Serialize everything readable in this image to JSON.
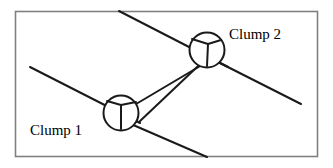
{
  "figure": {
    "background_color": "#ffffff",
    "border": {
      "color": "#808080",
      "width": 1.6,
      "x": 15.5,
      "y": 11.5,
      "w": 302,
      "h": 145
    },
    "stroke_color": "#1a1a1a",
    "line_width": 2.0,
    "labels": [
      {
        "id": "clump-1",
        "text": "Clump 1",
        "x": 30,
        "y": 135,
        "font_size": 15,
        "anchor": "start"
      },
      {
        "id": "clump-2",
        "text": "Clump 2",
        "x": 229,
        "y": 39,
        "font_size": 15,
        "anchor": "start"
      }
    ],
    "nodes": [
      {
        "id": "clump-1-node",
        "name": "clump-1-circle",
        "cx": 121,
        "cy": 113,
        "r": 17.5,
        "vertex_x": 121,
        "vertex_y": 105,
        "spokes": [
          {
            "x": 107,
            "y": 101
          },
          {
            "x": 136,
            "y": 102
          },
          {
            "x": 121,
            "y": 129
          }
        ]
      },
      {
        "id": "clump-2-node",
        "name": "clump-2-circle",
        "cx": 207,
        "cy": 50,
        "r": 17.5,
        "vertex_x": 208,
        "vertex_y": 44,
        "spokes": [
          {
            "x": 192,
            "y": 39
          },
          {
            "x": 221,
            "y": 40
          },
          {
            "x": 207,
            "y": 66
          }
        ]
      }
    ],
    "through_lines": [
      {
        "id": "line-upper-left-to-clump2",
        "name": "through-line-top-left",
        "x1": 119,
        "y1": 11,
        "x2": 228,
        "y2": 67
      },
      {
        "id": "line-clump2-to-lower-right",
        "name": "through-line-bottom-right",
        "x1": 210,
        "y1": 58,
        "x2": 301,
        "y2": 104
      },
      {
        "id": "line-left-to-clump1",
        "name": "through-line-mid-left",
        "x1": 30,
        "y1": 67,
        "x2": 140,
        "y2": 123
      },
      {
        "id": "line-clump1-to-bottom",
        "name": "through-line-bottom-center",
        "x1": 124,
        "y1": 121,
        "x2": 207,
        "y2": 157
      }
    ],
    "connector": {
      "id": "clump-connector-rod",
      "name": "clump-connector",
      "rail_a": {
        "x1": 131,
        "y1": 107,
        "x2": 207,
        "y2": 62
      },
      "rail_b": {
        "x1": 139,
        "y1": 122,
        "x2": 215,
        "y2": 50
      }
    }
  }
}
